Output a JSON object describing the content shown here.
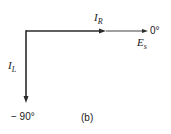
{
  "diagram": {
    "type": "phasor-diagram",
    "caption": "(b)",
    "phasors": [
      {
        "name": "I_R",
        "symbol": "I",
        "subscript": "R",
        "angle_deg": 0,
        "direction": "right"
      },
      {
        "name": "E_s",
        "symbol": "E",
        "subscript": "s",
        "angle_deg": 0,
        "direction": "right"
      },
      {
        "name": "I_L",
        "symbol": "I",
        "subscript": "L",
        "angle_deg": -90,
        "direction": "down"
      }
    ],
    "angle_labels": {
      "zero": "0°",
      "minus_ninety": "− 90°"
    },
    "colors": {
      "line": "#2a2a2a",
      "text": "#1a1a1a",
      "background": "#ffffff"
    }
  }
}
